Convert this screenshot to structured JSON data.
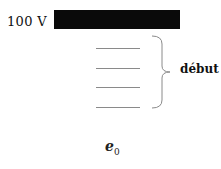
{
  "diagram": {
    "voltage_label": "100 V",
    "brace_label": "début",
    "epsilon_symbol": "e",
    "epsilon_subscript": "0",
    "lines_count": 4,
    "colors": {
      "plate": "#0a0a0a",
      "lines": "#8a8a8a",
      "text": "#111111"
    }
  }
}
